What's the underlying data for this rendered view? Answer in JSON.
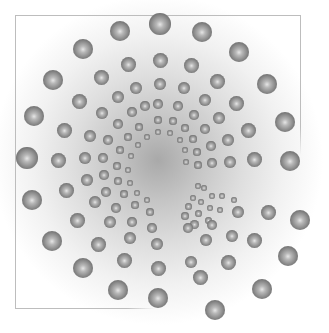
{
  "image": {
    "description": "Radial spiral of shaded grey spheres on a white-to-grey radial gradient inside a partial thin frame",
    "center": [
      158,
      160
    ],
    "background_color": "#ffffff",
    "gradient_center_color": "#a9a9a9",
    "frame_color": "#bdbdbd",
    "sphere_color_dark": "#505050",
    "sphere_color_light": "#e6e6e6"
  },
  "dots": [
    [
      160,
      24,
      11
    ],
    [
      202,
      32,
      10
    ],
    [
      239,
      52,
      10
    ],
    [
      267,
      84,
      10
    ],
    [
      285,
      122,
      10
    ],
    [
      290,
      161,
      10
    ],
    [
      300,
      220,
      10
    ],
    [
      288,
      256,
      10
    ],
    [
      262,
      289,
      10
    ],
    [
      215,
      310,
      10
    ],
    [
      158,
      298,
      10
    ],
    [
      118,
      290,
      10
    ],
    [
      83,
      268,
      10
    ],
    [
      52,
      241,
      10
    ],
    [
      32,
      200,
      10
    ],
    [
      27,
      158,
      11
    ],
    [
      34,
      116,
      10
    ],
    [
      53,
      80,
      10
    ],
    [
      83,
      49,
      10
    ],
    [
      120,
      31,
      10
    ],
    [
      160,
      60,
      7.5
    ],
    [
      191,
      65,
      7.5
    ],
    [
      217,
      81,
      7.5
    ],
    [
      236,
      103,
      7.5
    ],
    [
      248,
      130,
      7.5
    ],
    [
      254,
      159,
      7.5
    ],
    [
      268,
      212,
      7.5
    ],
    [
      254,
      240,
      7.5
    ],
    [
      228,
      262,
      7.5
    ],
    [
      200,
      277,
      7.5
    ],
    [
      158,
      268,
      7.5
    ],
    [
      124,
      260,
      7.5
    ],
    [
      98,
      244,
      7.5
    ],
    [
      77,
      220,
      7.5
    ],
    [
      66,
      190,
      7.5
    ],
    [
      58,
      160,
      7.5
    ],
    [
      64,
      130,
      7.5
    ],
    [
      79,
      101,
      7.5
    ],
    [
      101,
      77,
      7.5
    ],
    [
      128,
      64,
      7.5
    ],
    [
      160,
      84,
      6
    ],
    [
      184,
      88,
      6
    ],
    [
      205,
      100,
      6
    ],
    [
      219,
      118,
      6
    ],
    [
      228,
      140,
      6
    ],
    [
      230,
      162,
      6
    ],
    [
      238,
      212,
      6
    ],
    [
      232,
      236,
      6
    ],
    [
      206,
      240,
      6
    ],
    [
      191,
      262,
      6
    ],
    [
      157,
      244,
      6
    ],
    [
      130,
      238,
      6
    ],
    [
      110,
      222,
      6
    ],
    [
      95,
      202,
      6
    ],
    [
      87,
      180,
      6
    ],
    [
      85,
      158,
      6
    ],
    [
      90,
      136,
      6
    ],
    [
      102,
      113,
      6
    ],
    [
      118,
      97,
      6
    ],
    [
      136,
      88,
      6
    ],
    [
      158,
      104,
      4.8
    ],
    [
      178,
      106,
      4.8
    ],
    [
      194,
      115,
      4.8
    ],
    [
      205,
      129,
      4.8
    ],
    [
      211,
      146,
      4.8
    ],
    [
      212,
      163,
      4.8
    ],
    [
      152,
      228,
      4.8
    ],
    [
      132,
      222,
      4.8
    ],
    [
      116,
      208,
      4.8
    ],
    [
      106,
      192,
      4.8
    ],
    [
      104,
      175,
      4.8
    ],
    [
      103,
      158,
      4.8
    ],
    [
      108,
      140,
      4.8
    ],
    [
      118,
      124,
      4.8
    ],
    [
      132,
      112,
      4.8
    ],
    [
      145,
      106,
      4.8
    ],
    [
      158,
      120,
      3.8
    ],
    [
      173,
      121,
      3.8
    ],
    [
      185,
      128,
      3.8
    ],
    [
      193,
      139,
      3.8
    ],
    [
      197,
      152,
      3.8
    ],
    [
      198,
      165,
      3.8
    ],
    [
      150,
      212,
      3.8
    ],
    [
      135,
      205,
      3.8
    ],
    [
      124,
      194,
      3.8
    ],
    [
      118,
      181,
      3.8
    ],
    [
      117,
      166,
      3.8
    ],
    [
      120,
      150,
      3.8
    ],
    [
      128,
      137,
      3.8
    ],
    [
      139,
      127,
      3.8
    ],
    [
      158,
      132,
      3
    ],
    [
      170,
      133,
      3
    ],
    [
      180,
      140,
      3
    ],
    [
      185,
      150,
      3
    ],
    [
      186,
      162,
      3
    ],
    [
      147,
      200,
      3
    ],
    [
      137,
      193,
      3
    ],
    [
      130,
      183,
      3
    ],
    [
      128,
      170,
      3
    ],
    [
      131,
      156,
      3
    ],
    [
      138,
      145,
      3
    ],
    [
      147,
      137,
      3
    ],
    [
      198,
      186,
      3.2
    ],
    [
      204,
      188,
      3.2
    ],
    [
      212,
      196,
      3.2
    ],
    [
      222,
      196,
      3.2
    ],
    [
      234,
      200,
      3.2
    ],
    [
      193,
      198,
      3.2
    ],
    [
      201,
      202,
      3.2
    ],
    [
      210,
      208,
      3.2
    ],
    [
      220,
      210,
      3.2
    ],
    [
      188,
      206,
      3.5
    ],
    [
      198,
      213,
      3.5
    ],
    [
      208,
      220,
      3.5
    ],
    [
      185,
      216,
      4
    ],
    [
      194,
      224,
      4.5
    ],
    [
      212,
      225,
      5
    ],
    [
      188,
      228,
      5
    ]
  ]
}
